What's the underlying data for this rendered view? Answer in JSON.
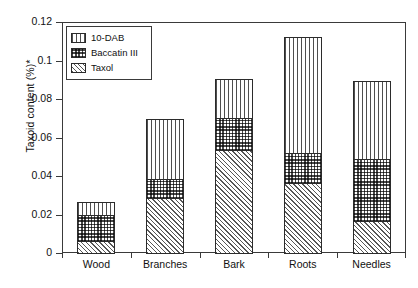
{
  "chart_data": {
    "type": "bar",
    "subtype": "stacked-bar",
    "title": "",
    "xlabel": "",
    "ylabel": "Taxoid content (%)*",
    "categories": [
      "Wood",
      "Branches",
      "Bark",
      "Roots",
      "Needles"
    ],
    "ylim": [
      0,
      0.12
    ],
    "ytick_labels": [
      "0",
      "0.02",
      "0.04",
      "0.06",
      "0.08",
      "0.1",
      "0.12"
    ],
    "ytick_values": [
      0,
      0.02,
      0.04,
      0.06,
      0.08,
      0.1,
      0.12
    ],
    "grid": false,
    "legend_position": "top-left-inside",
    "stack_order_bottom_to_top": [
      "Taxol",
      "Baccatin III",
      "10-DAB"
    ],
    "series": [
      {
        "name": "Taxol",
        "pattern": "diagonal-hatch",
        "values": [
          0.007,
          0.029,
          0.054,
          0.037,
          0.017
        ]
      },
      {
        "name": "Baccatin III",
        "pattern": "checker-dots",
        "values": [
          0.014,
          0.0105,
          0.017,
          0.016,
          0.033
        ]
      },
      {
        "name": "10-DAB",
        "pattern": "vertical-lines",
        "values": [
          0.007,
          0.0315,
          0.021,
          0.061,
          0.041
        ]
      }
    ],
    "cumulative_totals": [
      0.028,
      0.071,
      0.092,
      0.114,
      0.091
    ]
  },
  "legend": {
    "items": [
      {
        "label": "10-DAB"
      },
      {
        "label": "Baccatin III"
      },
      {
        "label": "Taxol"
      }
    ]
  },
  "axes": {
    "y_title": "Taxoid content (%)*"
  },
  "colors": {
    "axis": "#3a3a3a",
    "bar_outline": "#2b2b2b",
    "hatch": "#4f4f4f",
    "background": "#ffffff",
    "text": "#111111"
  }
}
